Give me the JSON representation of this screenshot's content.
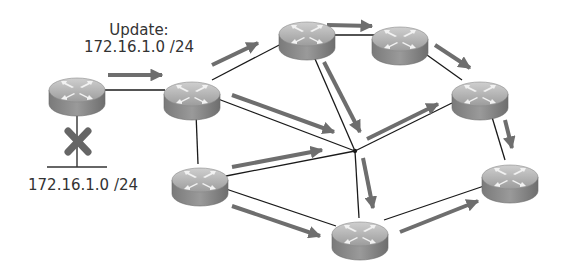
{
  "diagram": {
    "type": "network-routing-update-propagation",
    "labels": {
      "update_title": "Update:",
      "update_prefix": "172.16.1.0 /24",
      "subnet_label": "172.16.1.0 /24"
    },
    "colors": {
      "link": "#1a1a1a",
      "arrow": "#6e6e6e",
      "router_top": "#b8b8b8",
      "router_side": "#8a8a8a",
      "router_glyph": "#f2f2f2",
      "failure_x": "#666666",
      "text": "#333333"
    },
    "routers": [
      {
        "id": "R1",
        "cx": 77,
        "cy": 90
      },
      {
        "id": "R2",
        "cx": 192,
        "cy": 95
      },
      {
        "id": "R3",
        "cx": 307,
        "cy": 35
      },
      {
        "id": "R4",
        "cx": 400,
        "cy": 40
      },
      {
        "id": "R5",
        "cx": 480,
        "cy": 97
      },
      {
        "id": "R6",
        "cx": 510,
        "cy": 180
      },
      {
        "id": "R7",
        "cx": 360,
        "cy": 237
      },
      {
        "id": "R8",
        "cx": 200,
        "cy": 183
      }
    ],
    "hub": {
      "x": 355,
      "y": 151
    },
    "links": [
      {
        "from": "R1",
        "to": "R2"
      },
      {
        "from": "R2",
        "to": "R3"
      },
      {
        "from": "R3",
        "to": "R4"
      },
      {
        "from": "R4",
        "to": "R5"
      },
      {
        "from": "R5",
        "to": "R6"
      },
      {
        "from": "R6",
        "to": "R7"
      },
      {
        "from": "R2",
        "to": "R8"
      },
      {
        "from": "R8",
        "to": "R7"
      },
      {
        "from": "R2",
        "to": "HUB"
      },
      {
        "from": "R3",
        "to": "HUB"
      },
      {
        "from": "R5",
        "to": "HUB"
      },
      {
        "from": "R8",
        "to": "HUB"
      },
      {
        "from": "R7",
        "to": "HUB"
      }
    ],
    "arrows": [
      {
        "x1": 108,
        "y1": 75,
        "x2": 162,
        "y2": 75
      },
      {
        "x1": 212,
        "y1": 65,
        "x2": 258,
        "y2": 43
      },
      {
        "x1": 327,
        "y1": 25,
        "x2": 370,
        "y2": 26
      },
      {
        "x1": 435,
        "y1": 45,
        "x2": 470,
        "y2": 68
      },
      {
        "x1": 505,
        "y1": 120,
        "x2": 512,
        "y2": 148
      },
      {
        "x1": 400,
        "y1": 232,
        "x2": 478,
        "y2": 200
      },
      {
        "x1": 232,
        "y1": 95,
        "x2": 334,
        "y2": 132
      },
      {
        "x1": 324,
        "y1": 62,
        "x2": 360,
        "y2": 132
      },
      {
        "x1": 367,
        "y1": 139,
        "x2": 438,
        "y2": 104
      },
      {
        "x1": 232,
        "y1": 167,
        "x2": 322,
        "y2": 150
      },
      {
        "x1": 363,
        "y1": 158,
        "x2": 373,
        "y2": 208
      },
      {
        "x1": 232,
        "y1": 206,
        "x2": 320,
        "y2": 236
      }
    ],
    "failed_segment": {
      "stub_from": {
        "x": 77,
        "y": 112
      },
      "stub_to": {
        "x": 77,
        "y": 167
      },
      "lan_bar": {
        "x1": 47,
        "y1": 167,
        "x2": 107,
        "y2": 167
      },
      "x_mark": {
        "cx": 78,
        "cy": 142
      }
    }
  }
}
